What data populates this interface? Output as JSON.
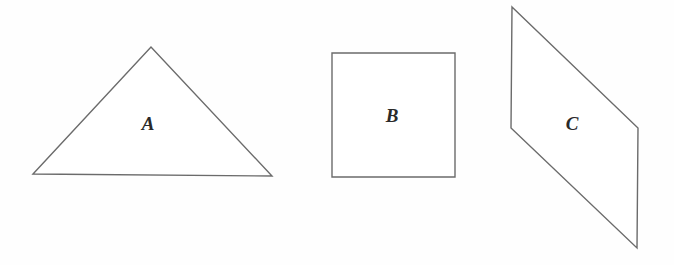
{
  "figure": {
    "background_color": "#fefefe",
    "stroke_color": "#6b6b6b",
    "label_color": "#2a2a2a",
    "width": 674,
    "height": 265,
    "shapes": [
      {
        "id": "triangle-a",
        "kind": "triangle",
        "label": "A",
        "label_x": 148,
        "label_y": 124,
        "points": "33,174 151,47 272,176"
      },
      {
        "id": "square-b",
        "kind": "square",
        "label": "B",
        "label_x": 392,
        "label_y": 116,
        "points": "332,53 455,53 455,177 332,177"
      },
      {
        "id": "parallelogram-c",
        "kind": "parallelogram",
        "label": "C",
        "label_x": 572,
        "label_y": 124,
        "points": "512,7 638,128 637,248 511,128"
      }
    ]
  }
}
